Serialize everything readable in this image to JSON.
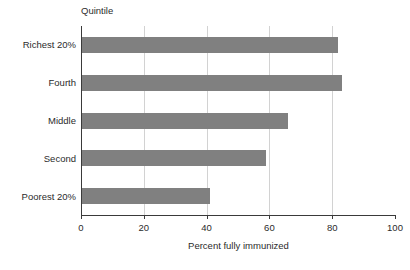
{
  "chart_data": {
    "type": "bar",
    "orientation": "horizontal",
    "title": "Quintile",
    "xlabel": "Percent fully immunized",
    "ylabel": "Quintile",
    "categories": [
      "Poorest 20%",
      "Second",
      "Middle",
      "Fourth",
      "Richest 20%"
    ],
    "values": [
      41,
      59,
      66,
      83,
      82
    ],
    "xlim": [
      0,
      100
    ],
    "xticks": [
      0,
      20,
      40,
      60,
      80,
      100
    ],
    "xtick_labels": [
      "0",
      "20",
      "40",
      "60",
      "80",
      "100"
    ],
    "grid": "vertical",
    "legend": "none",
    "bar_color": "#808080",
    "axis_color": "#3a3a3a",
    "gridline_color": "#d2d2d2",
    "series": [
      {
        "name": "Percent fully immunized",
        "values": [
          41,
          59,
          66,
          83,
          82
        ]
      }
    ],
    "annotations": []
  },
  "chart": {
    "title": "Quintile",
    "xaxis_title": "Percent fully immunized",
    "ticks": [
      {
        "label": "0",
        "value": 0
      },
      {
        "label": "20",
        "value": 20
      },
      {
        "label": "40",
        "value": 40
      },
      {
        "label": "60",
        "value": 60
      },
      {
        "label": "80",
        "value": 80
      },
      {
        "label": "100",
        "value": 100
      }
    ],
    "bars": [
      {
        "label": "Richest 20%",
        "value": 82
      },
      {
        "label": "Fourth",
        "value": 83
      },
      {
        "label": "Middle",
        "value": 66
      },
      {
        "label": "Second",
        "value": 59
      },
      {
        "label": "Poorest 20%",
        "value": 41
      }
    ]
  }
}
